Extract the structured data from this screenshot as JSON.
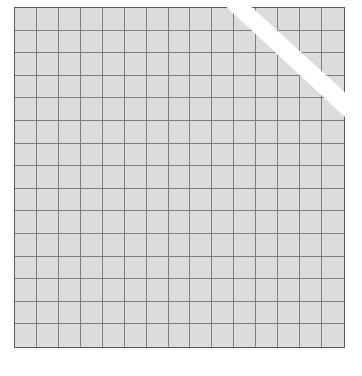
{
  "grid": {
    "rows": 15,
    "columns": 15,
    "cell_fill": "#dcdcdc",
    "line_color": "#7e7e7e",
    "border_color": "#5c5c5c"
  },
  "overlay": {
    "type": "diagonal-stripe",
    "color": "#ffffff",
    "position": "top-right corner"
  },
  "background": "#ffffff"
}
